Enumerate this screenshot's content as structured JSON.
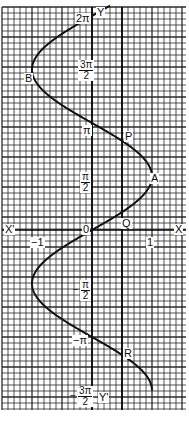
{
  "chart_data": {
    "type": "line",
    "title": "",
    "xlabel": "X",
    "xlabel_neg": "X'",
    "ylabel": "Y",
    "ylabel_neg": "Y'",
    "function": "x = sin y",
    "xlim": [
      -1.5,
      1.55
    ],
    "ylim": [
      -5.0,
      6.6
    ],
    "grid": true,
    "origin_label": "0",
    "x_ticks": [
      {
        "value": -1,
        "label": "−1"
      },
      {
        "value": 1,
        "label": "1"
      }
    ],
    "y_ticks": [
      {
        "value": 6.2832,
        "label": "2π"
      },
      {
        "value": 4.7124,
        "num": "3π",
        "den": "2",
        "sign": ""
      },
      {
        "value": 3.1416,
        "label": "π"
      },
      {
        "value": 1.5708,
        "num": "π",
        "den": "2",
        "sign": ""
      },
      {
        "value": -1.5708,
        "num": "π",
        "den": "2",
        "sign": "−"
      },
      {
        "value": -3.1416,
        "label": "−π"
      },
      {
        "value": -4.7124,
        "num": "3π",
        "den": "2",
        "sign": "−"
      }
    ],
    "reference_line": {
      "x": 0.5,
      "label": "x = 1/2"
    },
    "points": [
      {
        "name": "A",
        "x": 1,
        "y": 1.5708
      },
      {
        "name": "B",
        "x": -1,
        "y": 4.7124
      },
      {
        "name": "P",
        "x": 0.5,
        "y": 2.618
      },
      {
        "name": "Q",
        "x": 0.5,
        "y": 0.5236
      },
      {
        "name": "R",
        "x": 0.5,
        "y": -3.6652
      }
    ],
    "series": [
      {
        "name": "x = sin y",
        "y_range": [
          -4.7124,
          6.6
        ],
        "color": "#111111"
      }
    ]
  },
  "labels": {
    "x_pos": "X",
    "x_neg": "X'",
    "y_pos": "Y",
    "y_neg": "Y'",
    "origin": "0",
    "x_one": "1",
    "x_minus_one": "−1",
    "two_pi": "2π",
    "pi": "π",
    "minus_pi": "−π",
    "three_pi_num": "3π",
    "pi_num": "π",
    "den_two": "2",
    "minus": "−",
    "point_a": "A",
    "point_b": "B",
    "point_p": "P",
    "point_q": "Q",
    "point_r": "R"
  },
  "colors": {
    "grid": "#2a2a2a",
    "curve": "#111111",
    "background": "#ffffff"
  }
}
